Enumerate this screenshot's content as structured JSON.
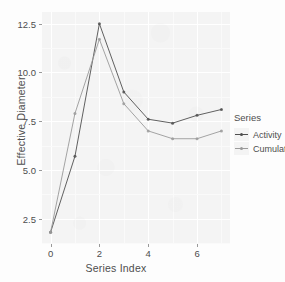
{
  "chart_data": {
    "type": "line",
    "title": "",
    "xlabel": "Series Index",
    "ylabel": "Effective Diameter",
    "x": [
      0,
      1,
      2,
      3,
      4,
      5,
      6,
      7
    ],
    "xlim": [
      -0.35,
      7.35
    ],
    "ylim": [
      1.2,
      13.1
    ],
    "xticks": [
      0,
      2,
      4,
      6
    ],
    "xticklabels": [
      "0",
      "2",
      "4",
      "6"
    ],
    "yticks": [
      2.5,
      5.0,
      7.5,
      10.0,
      12.5
    ],
    "yticklabels": [
      "2.5",
      "5.0",
      "7.5",
      "10.0",
      "12.5"
    ],
    "grid": true,
    "legend_position": "right",
    "legend_title": "Series",
    "series": [
      {
        "name": "Activity",
        "color": "#4f4f4f",
        "values": [
          1.8,
          5.7,
          12.5,
          9.0,
          7.6,
          7.4,
          7.8,
          8.1
        ]
      },
      {
        "name": "Cumulative",
        "color": "#9a9a9a",
        "values": [
          1.8,
          7.9,
          11.7,
          8.4,
          7.0,
          6.6,
          6.6,
          7.0
        ]
      }
    ]
  },
  "panel": {
    "background": "#f4f4f4",
    "gridline_color": "#ffffff"
  }
}
